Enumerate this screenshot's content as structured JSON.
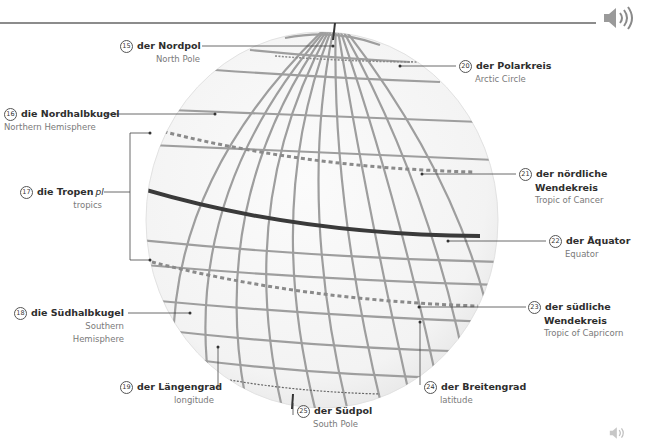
{
  "header": {
    "audio_icon": "speaker-icon"
  },
  "footer": {
    "audio_icon": "speaker-icon"
  },
  "colors": {
    "rule_line": "#8c8c8c",
    "grid": "#9e9e9e",
    "equator": "#3a3a3a",
    "globe_fill": "#f6f6f6",
    "leader": "#444444"
  },
  "labels": [
    {
      "num": "15",
      "de": "der Nordpol",
      "en": "North Pole"
    },
    {
      "num": "16",
      "de": "die Nordhalbkugel",
      "en": "Northern Hemisphere"
    },
    {
      "num": "17",
      "de": "die Tropen",
      "pl": "pl",
      "en": "tropics"
    },
    {
      "num": "18",
      "de": "die Südhalbkugel",
      "en": "Southern",
      "en2": "Hemisphere"
    },
    {
      "num": "19",
      "de": "der Längengrad",
      "en": "longitude"
    },
    {
      "num": "20",
      "de": "der Polarkreis",
      "en": "Arctic Circle"
    },
    {
      "num": "21",
      "de": "der nördliche",
      "de2": "Wendekreis",
      "en": "Tropic of Cancer"
    },
    {
      "num": "22",
      "de": "der Äquator",
      "en": "Equator"
    },
    {
      "num": "23",
      "de": "der südliche",
      "de2": "Wendekreis",
      "en": "Tropic of Capricorn"
    },
    {
      "num": "24",
      "de": "der Breitengrad",
      "en": "latitude"
    },
    {
      "num": "25",
      "de": "der Südpol",
      "en": "South Pole"
    }
  ]
}
